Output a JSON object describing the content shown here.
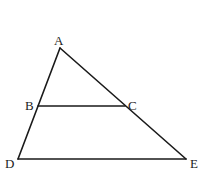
{
  "diagram": {
    "type": "geometry-triangle",
    "points": {
      "A": {
        "label": "A",
        "x": 60,
        "y": 48,
        "label_x": 54,
        "label_y": 45
      },
      "B": {
        "label": "B",
        "x": 38,
        "y": 106,
        "label_x": 25,
        "label_y": 110
      },
      "C": {
        "label": "C",
        "x": 125,
        "y": 106,
        "label_x": 128,
        "label_y": 110
      },
      "D": {
        "label": "D",
        "x": 18,
        "y": 159,
        "label_x": 5,
        "label_y": 168
      },
      "E": {
        "label": "E",
        "x": 186,
        "y": 159,
        "label_x": 190,
        "label_y": 168
      }
    },
    "segments": [
      {
        "from": "A",
        "to": "D"
      },
      {
        "from": "A",
        "to": "E"
      },
      {
        "from": "D",
        "to": "E"
      },
      {
        "from": "B",
        "to": "C"
      }
    ],
    "line_color": "#1a1a1a",
    "label_color": "#222222"
  }
}
